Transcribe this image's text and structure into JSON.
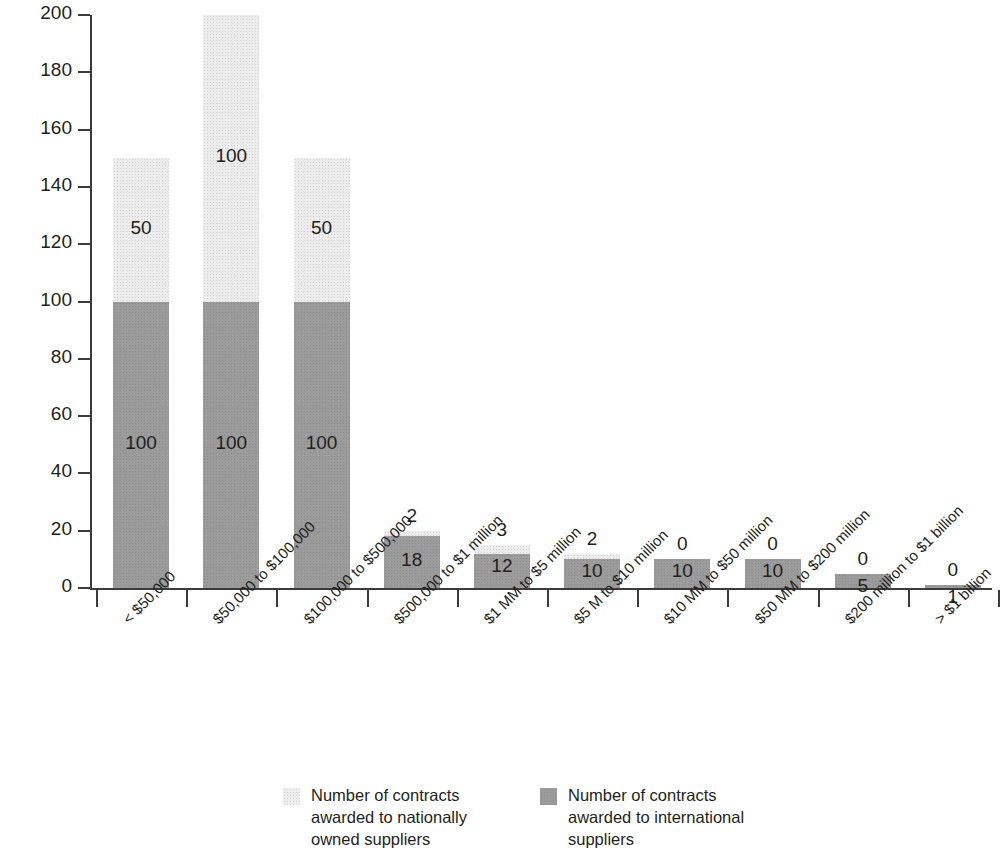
{
  "chart_data": {
    "type": "bar",
    "subtype": "stacked-bar",
    "title": "",
    "xlabel": "",
    "ylabel": "Number of contracts",
    "ylim": [
      0,
      200
    ],
    "ytick_labels": [
      "0",
      "20",
      "40",
      "60",
      "80",
      "100",
      "120",
      "140",
      "160",
      "180",
      "200"
    ],
    "ytick_values": [
      0,
      20,
      40,
      60,
      80,
      100,
      120,
      140,
      160,
      180,
      200
    ],
    "grid": false,
    "legend_position": "bottom",
    "categories": [
      "< $50,000",
      "$50,000 to $100,000",
      "$100,000 to $500,000",
      "$500,000 to $1 million",
      "$1 MM to $5 million",
      "$5 M to $10 million",
      "$10 MM to $50 million",
      "$50 MM to $200 million",
      "$200 million to $1 billion",
      "> $1 billion"
    ],
    "series": [
      {
        "name": "Number of contracts awarded to international suppliers",
        "color": "#9b9b9b",
        "values": [
          100,
          100,
          100,
          18,
          12,
          10,
          10,
          10,
          5,
          1
        ]
      },
      {
        "name": "Number of contracts awarded to nationally owned suppliers",
        "color": "#ededed",
        "values": [
          50,
          100,
          50,
          2,
          3,
          2,
          0,
          0,
          0,
          0
        ]
      }
    ]
  },
  "legend": [
    {
      "swatch": "national",
      "lines": [
        "Number of contracts",
        "awarded to nationally",
        "owned suppliers"
      ]
    },
    {
      "swatch": "international",
      "lines": [
        "Number of contracts",
        "awarded to international",
        "suppliers"
      ]
    }
  ]
}
